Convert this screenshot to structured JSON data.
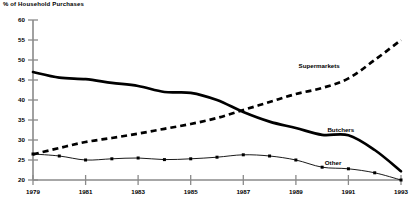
{
  "chart_data": {
    "type": "line",
    "title": "% of Household Purchases",
    "xlabel": "",
    "ylabel": "% of Household Purchases",
    "xlim": [
      1979,
      1993
    ],
    "ylim": [
      20,
      60
    ],
    "grid": false,
    "legend_position": "inline-annotations",
    "x": [
      1979,
      1980,
      1981,
      1982,
      1983,
      1984,
      1985,
      1986,
      1987,
      1988,
      1989,
      1990,
      1991,
      1992,
      1993
    ],
    "xticks": [
      "1979",
      "1981",
      "1983",
      "1985",
      "1987",
      "1989",
      "1991",
      "1993"
    ],
    "xtick_values": [
      1979,
      1981,
      1983,
      1985,
      1987,
      1989,
      1991,
      1993
    ],
    "yticks": [
      "20",
      "25",
      "30",
      "35",
      "40",
      "45",
      "50",
      "55",
      "60"
    ],
    "ytick_values": [
      20,
      25,
      30,
      35,
      40,
      45,
      50,
      55,
      60
    ],
    "series": [
      {
        "name": "Butchers",
        "style": "solid-thick",
        "label_x": 1990.2,
        "label_y": 32.0,
        "values": [
          47.0,
          45.6,
          45.2,
          44.3,
          43.5,
          42.0,
          41.8,
          40.0,
          37.0,
          34.6,
          33.0,
          31.3,
          31.2,
          27.5,
          22.2
        ]
      },
      {
        "name": "Supermarkets",
        "style": "dashed-thick",
        "label_x": 1989.1,
        "label_y": 48.0,
        "values": [
          26.4,
          28.0,
          29.5,
          30.5,
          31.6,
          32.8,
          34.0,
          35.5,
          37.5,
          39.5,
          41.5,
          43.0,
          45.4,
          50.0,
          55.0
        ]
      },
      {
        "name": "Other",
        "style": "solid-thin-markers",
        "label_x": 1990.1,
        "label_y": 23.8,
        "values": [
          26.5,
          26.0,
          25.0,
          25.3,
          25.5,
          25.1,
          25.3,
          25.7,
          26.3,
          26.0,
          25.0,
          23.2,
          22.8,
          21.8,
          20.0
        ]
      }
    ]
  },
  "labels": {
    "title": "% of Household Purchases",
    "supermarkets": "Supermarkets",
    "butchers": "Butchers",
    "other": "Other",
    "y_20": "20",
    "y_25": "25",
    "y_30": "30",
    "y_35": "35",
    "y_40": "40",
    "y_45": "45",
    "y_50": "50",
    "y_55": "55",
    "y_60": "60",
    "x_1979": "1979",
    "x_1981": "1981",
    "x_1983": "1983",
    "x_1985": "1985",
    "x_1987": "1987",
    "x_1989": "1989",
    "x_1991": "1991",
    "x_1993": "1993"
  },
  "colors": {
    "axis": "#8a8a8a",
    "series": "#000000",
    "background": "#ffffff"
  }
}
